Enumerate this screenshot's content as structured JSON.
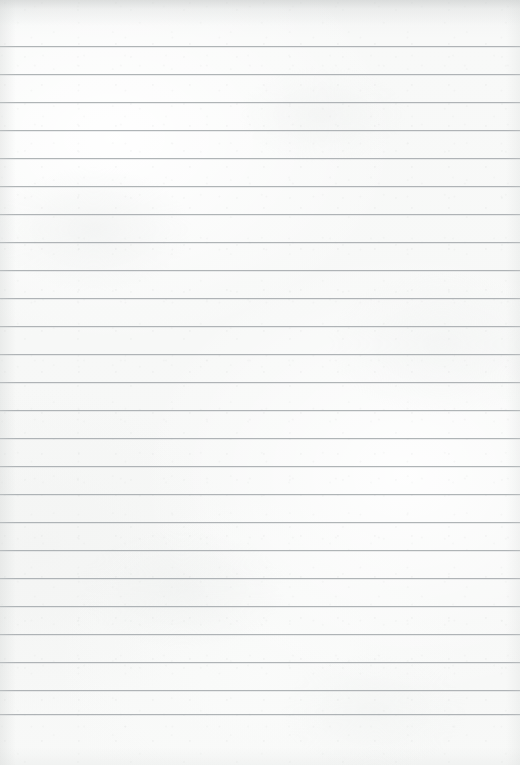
{
  "document": {
    "kind": "ruled-notebook-paper",
    "title": "",
    "page_width": 520,
    "page_height": 765,
    "orientation": "portrait",
    "content_text": "",
    "is_blank": true
  },
  "paper": {
    "background_color": "#f7f8f7",
    "texture": "subtle paper grain and mottling",
    "edge_shadow_color": "#c6c9c8"
  },
  "ruling": {
    "style": "horizontal ruled lines",
    "line_color": "#a9aeb1",
    "line_thickness_px": 1,
    "line_spacing_px": 28,
    "first_line_y": 46,
    "last_line_y": 714,
    "line_count": 25,
    "left_inset_px": 0,
    "right_inset_px": 0,
    "has_margin_rule": false,
    "has_header_rule": false,
    "line_positions": [
      46,
      74,
      102,
      130,
      158,
      186,
      214,
      242,
      270,
      298,
      326,
      354,
      382,
      410,
      438,
      466,
      494,
      522,
      550,
      578,
      606,
      634,
      662,
      690,
      714
    ]
  },
  "lines": [
    {
      "index": 1,
      "y": 46,
      "text": ""
    },
    {
      "index": 2,
      "y": 74,
      "text": ""
    },
    {
      "index": 3,
      "y": 102,
      "text": ""
    },
    {
      "index": 4,
      "y": 130,
      "text": ""
    },
    {
      "index": 5,
      "y": 158,
      "text": ""
    },
    {
      "index": 6,
      "y": 186,
      "text": ""
    },
    {
      "index": 7,
      "y": 214,
      "text": ""
    },
    {
      "index": 8,
      "y": 242,
      "text": ""
    },
    {
      "index": 9,
      "y": 270,
      "text": ""
    },
    {
      "index": 10,
      "y": 298,
      "text": ""
    },
    {
      "index": 11,
      "y": 326,
      "text": ""
    },
    {
      "index": 12,
      "y": 354,
      "text": ""
    },
    {
      "index": 13,
      "y": 382,
      "text": ""
    },
    {
      "index": 14,
      "y": 410,
      "text": ""
    },
    {
      "index": 15,
      "y": 438,
      "text": ""
    },
    {
      "index": 16,
      "y": 466,
      "text": ""
    },
    {
      "index": 17,
      "y": 494,
      "text": ""
    },
    {
      "index": 18,
      "y": 522,
      "text": ""
    },
    {
      "index": 19,
      "y": 550,
      "text": ""
    },
    {
      "index": 20,
      "y": 578,
      "text": ""
    },
    {
      "index": 21,
      "y": 606,
      "text": ""
    },
    {
      "index": 22,
      "y": 634,
      "text": ""
    },
    {
      "index": 23,
      "y": 662,
      "text": ""
    },
    {
      "index": 24,
      "y": 690,
      "text": ""
    },
    {
      "index": 25,
      "y": 714,
      "text": ""
    }
  ]
}
